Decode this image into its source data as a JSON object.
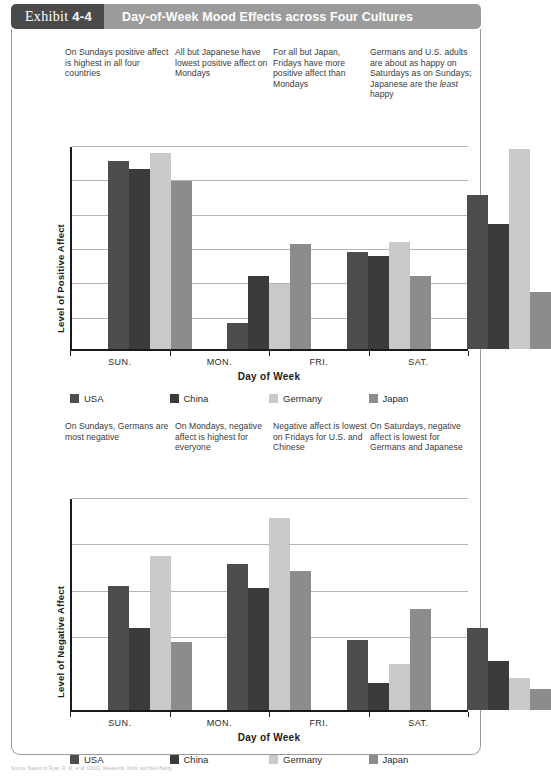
{
  "header": {
    "exhibit_prefix": "Exhibit",
    "exhibit_number": "4-4",
    "title": "Day-of-Week Mood Effects across Four Cultures"
  },
  "annotations_top": [
    "On Sundays positive affect is highest in all four countries",
    "All but Japanese have lowest positive affect on Mondays",
    "For all but Japan, Fridays have more positive affect than Mondays",
    "Germans and U.S. adults are about as happy on Saturdays as on Sundays; Japanese are the least happy"
  ],
  "annotations_mid": [
    "On Sundays, Germans are most negative",
    "On Mondays, negative affect is highest for everyone",
    "Negative affect is lowest on Fridays for U.S. and Chinese",
    "On Saturdays, negative affect is lowest for Germans and Japanese"
  ],
  "colors": {
    "usa": "#4d4d4d",
    "china": "#3b3b3b",
    "germany": "#c9c9c9",
    "japan": "#8c8c8c",
    "badge": "#4a4a4a",
    "title_bar": "#9b9b9b",
    "gridline": "#b5b5b5",
    "axis": "#1a1a1a"
  },
  "legend": [
    {
      "label": "USA",
      "color_key": "usa"
    },
    {
      "label": "China",
      "color_key": "china"
    },
    {
      "label": "Germany",
      "color_key": "germany"
    },
    {
      "label": "Japan",
      "color_key": "japan"
    }
  ],
  "source": "Source: Based on Ryan, R. M., et al. (2010). Weekends, Work, and Well-Being.",
  "chart_data": [
    {
      "id": "positive-affect",
      "type": "bar",
      "title": "",
      "xlabel": "Day of Week",
      "ylabel": "Level of Positive Affect",
      "categories": [
        "SUN.",
        "MON.",
        "FRI.",
        "SAT."
      ],
      "ylim": [
        0,
        100
      ],
      "gridlines": [
        100,
        83,
        66,
        49,
        32,
        15
      ],
      "grid": true,
      "legend_position": "bottom",
      "series": [
        {
          "name": "USA",
          "color_key": "usa",
          "values": [
            93,
            13,
            48,
            76
          ]
        },
        {
          "name": "China",
          "color_key": "china",
          "values": [
            89,
            36,
            46,
            62
          ]
        },
        {
          "name": "Germany",
          "color_key": "germany",
          "values": [
            97,
            32,
            53,
            99
          ]
        },
        {
          "name": "Japan",
          "color_key": "japan",
          "values": [
            83,
            52,
            36,
            28
          ]
        }
      ]
    },
    {
      "id": "negative-affect",
      "type": "bar",
      "title": "",
      "xlabel": "Day of Week",
      "ylabel": "Level of Negative Affect",
      "categories": [
        "SUN.",
        "MON.",
        "FRI.",
        "SAT."
      ],
      "ylim": [
        0,
        100
      ],
      "gridlines": [
        100,
        78,
        56,
        34
      ],
      "grid": true,
      "legend_position": "bottom",
      "series": [
        {
          "name": "USA",
          "color_key": "usa",
          "values": [
            59,
            69,
            33,
            39
          ]
        },
        {
          "name": "China",
          "color_key": "china",
          "values": [
            39,
            58,
            13,
            23
          ]
        },
        {
          "name": "Germany",
          "color_key": "germany",
          "values": [
            73,
            91,
            22,
            15
          ]
        },
        {
          "name": "Japan",
          "color_key": "japan",
          "values": [
            32,
            66,
            48,
            10
          ]
        }
      ]
    }
  ]
}
